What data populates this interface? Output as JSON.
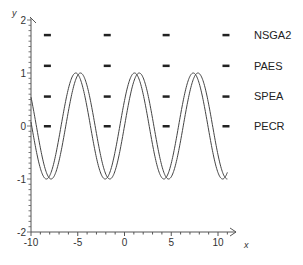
{
  "chart_data": {
    "type": "line",
    "title": "",
    "xlabel": "x",
    "ylabel": "y",
    "xlim": [
      -10,
      11.5
    ],
    "ylim": [
      -2,
      2
    ],
    "x_ticks": [
      -10,
      -5,
      0,
      5,
      10
    ],
    "y_ticks": [
      -2,
      -1,
      0,
      1,
      2
    ],
    "x_tick_labels": [
      "-10",
      "-5",
      "0",
      "5",
      "10"
    ],
    "y_tick_labels": [
      "-2",
      "-1",
      "0",
      "1",
      "2"
    ],
    "grid": false,
    "legend_placement": "right",
    "curves": [
      {
        "name": "sin(x)",
        "phase": 0,
        "amplitude": 1,
        "x_range": [
          -10,
          11
        ]
      },
      {
        "name": "sin(x+0.5)",
        "phase": 0.5,
        "amplitude": 1,
        "x_range": [
          -10,
          11
        ]
      }
    ],
    "marker_series": [
      {
        "name": "NSGA2",
        "y": 1.72,
        "x": [
          -8.3,
          -1.9,
          4.4,
          10.8
        ]
      },
      {
        "name": "PAES",
        "y": 1.14,
        "x": [
          -8.3,
          -1.9,
          4.4,
          10.8
        ]
      },
      {
        "name": "SPEA",
        "y": 0.56,
        "x": [
          -8.3,
          -1.9,
          4.4,
          10.8
        ]
      },
      {
        "name": "PECR",
        "y": 0.0,
        "x": [
          -8.3,
          -1.9,
          4.4,
          10.8
        ]
      }
    ],
    "colors": {
      "axis": "#555555",
      "curve": "#444444",
      "marker": "#222222"
    }
  }
}
